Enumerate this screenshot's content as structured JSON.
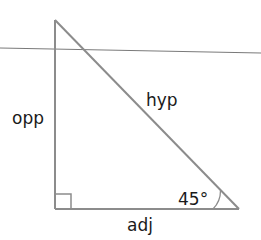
{
  "diagram": {
    "type": "right-triangle",
    "labels": {
      "opposite": "opp",
      "hypotenuse": "hyp",
      "adjacent": "adj",
      "angle": "45°"
    },
    "angle_degrees": 45,
    "right_angle_marker": true,
    "horizontal_reference_line": true,
    "colors": {
      "triangle_stroke": "#8c8c8c",
      "reference_line": "#7a7a7a",
      "text": "#1a1a1a",
      "background": "#ffffff"
    }
  }
}
